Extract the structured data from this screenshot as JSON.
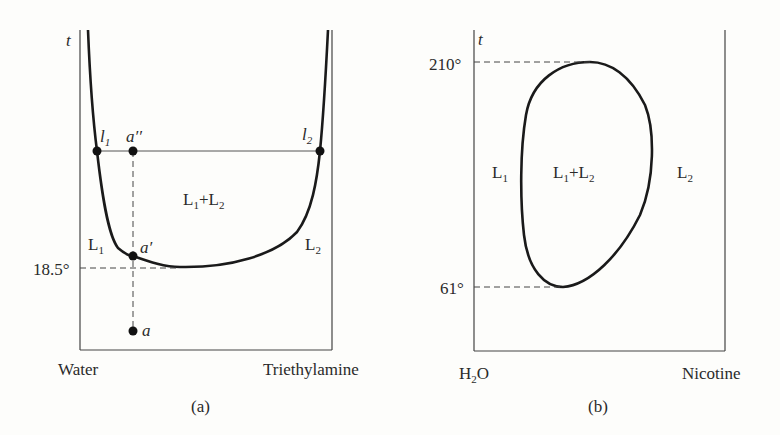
{
  "panel_a": {
    "caption": "(a)",
    "y_axis_label": "t",
    "x_left_label": "Water",
    "x_right_label": "Triethylamine",
    "temperature_label": "18.5°",
    "region_labels": {
      "left": "L",
      "left_sub": "1",
      "right": "L",
      "right_sub": "2",
      "center_a": "L",
      "center_a_sub": "1",
      "center_plus": "+",
      "center_b": "L",
      "center_b_sub": "2"
    },
    "points": {
      "l1": "l",
      "l1_sub": "1",
      "l2": "l",
      "l2_sub": "2",
      "a_double_prime": "a′′",
      "a_prime": "a′",
      "a": "a"
    }
  },
  "panel_b": {
    "caption": "(b)",
    "y_axis_label": "t",
    "x_left_label": "H",
    "x_left_sub": "2",
    "x_left_suffix": "O",
    "x_right_label": "Nicotine",
    "upper_temp_label": "210°",
    "lower_temp_label": "61°",
    "region_labels": {
      "left": "L",
      "left_sub": "1",
      "right": "L",
      "right_sub": "2",
      "center_a": "L",
      "center_a_sub": "1",
      "center_plus": "+",
      "center_b": "L",
      "center_b_sub": "2"
    }
  },
  "colors": {
    "ink": "#2a2a2a",
    "background": "#fdfdfb"
  }
}
